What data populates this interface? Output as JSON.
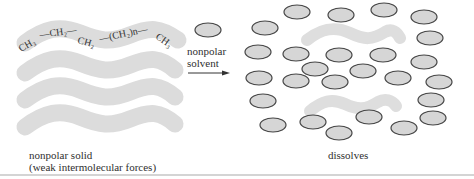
{
  "figure": {
    "solid": {
      "formula_parts": [
        "CH₃",
        "—CH₂—",
        "CH₂",
        "—(CH₂)n—",
        "CH₃"
      ],
      "caption_line1": "nonpolar solid",
      "caption_line2": "(weak intermolecular forces)",
      "chain_count": 4
    },
    "arrow": {
      "label_line1": "nonpolar",
      "label_line2": "solvent"
    },
    "result": {
      "caption": "dissolves",
      "solvent_molecule_count": 27,
      "dispersed_chain_count": 2
    },
    "colors": {
      "chain_fill": "#dcdcdc",
      "molecule_fill": "#d6d6d6",
      "molecule_stroke": "#444444",
      "text": "#2f2f2f"
    }
  }
}
